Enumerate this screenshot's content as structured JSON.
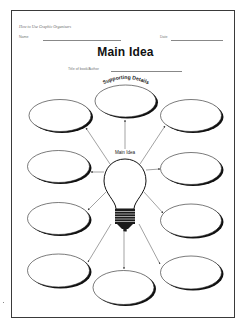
{
  "header": {
    "series_title": "How to Use Graphic Organizers",
    "name_label": "Name",
    "date_label": "Date"
  },
  "worksheet": {
    "title": "Main Idea",
    "book_author_label": "Title of book/Author",
    "supporting_details_label": "Supporting Details",
    "center_label": "Main Idea",
    "center_icon": "lightbulb-icon",
    "detail_ovals": [
      {
        "id": "top-center",
        "text": ""
      },
      {
        "id": "top-left",
        "text": ""
      },
      {
        "id": "top-right",
        "text": ""
      },
      {
        "id": "middle-left",
        "text": ""
      },
      {
        "id": "middle-right",
        "text": ""
      },
      {
        "id": "lower-left",
        "text": ""
      },
      {
        "id": "lower-right",
        "text": ""
      },
      {
        "id": "bottom-left",
        "text": ""
      },
      {
        "id": "bottom-center",
        "text": ""
      },
      {
        "id": "bottom-right",
        "text": ""
      }
    ]
  },
  "colors": {
    "ink": "#111111",
    "border": "#3a3a3a",
    "paper": "#ffffff"
  }
}
